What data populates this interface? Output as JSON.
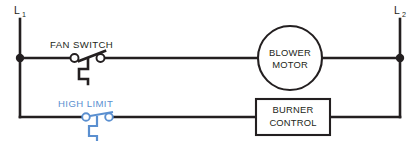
{
  "diagram": {
    "type": "electrical-ladder-schematic",
    "colors": {
      "wire": "#231f20",
      "highlight_blue": "#5a8fd0",
      "background": "#ffffff"
    },
    "rails": {
      "left": {
        "label": "L",
        "subscript": "1"
      },
      "right": {
        "label": "L",
        "subscript": "2"
      }
    },
    "rungs": [
      {
        "name": "blower-rung",
        "switch_label": "FAN  SWITCH",
        "load_line_1": "BLOWER",
        "load_line_2": "MOTOR",
        "load_shape": "circle",
        "color": "#231f20"
      },
      {
        "name": "burner-rung",
        "switch_label": "HIGH  LIMIT",
        "load_line_1": "BURNER",
        "load_line_2": "CONTROL",
        "load_shape": "rectangle",
        "color": "#5a8fd0"
      }
    ]
  }
}
